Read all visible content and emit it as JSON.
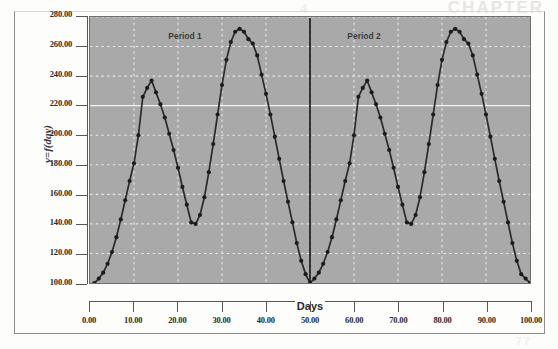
{
  "figure": {
    "y_axis_title": "y=f(day)",
    "x_axis_title": "Days",
    "annotations": [
      {
        "text": "Period 1",
        "x_day": 21.5,
        "y_value": 267.0
      },
      {
        "text": "Period 2",
        "x_day": 62.0,
        "y_value": 267.0
      }
    ],
    "divider_day": 50.0,
    "colors": {
      "plot_background": "#a9a9a9",
      "gridline": "#e8e8e8",
      "highlight_gridline": "#f2f2f2",
      "series_line": "#2a2a2a",
      "marker": "#1c1c1c",
      "axis": "#575757",
      "page_background": "#fdfdfc",
      "text": "#2b2b2b"
    },
    "ghost_text": {
      "top_right": "CHAPTER",
      "top_middle": "4",
      "bottom_right": "77"
    }
  },
  "chart_data": {
    "type": "line",
    "title": "",
    "subtitle": "",
    "xlabel": "Days",
    "ylabel": "y=f(day)",
    "xlim": [
      0,
      100
    ],
    "ylim": [
      100,
      280
    ],
    "xticks": [
      0,
      10,
      20,
      30,
      40,
      50,
      60,
      70,
      80,
      90,
      100
    ],
    "xtick_labels": [
      "0.00",
      "10.00",
      "20.00",
      "30.00",
      "40.00",
      "50.00",
      "60.00",
      "70.00",
      "80.00",
      "90.00",
      "100.00"
    ],
    "yticks": [
      100,
      120,
      140,
      160,
      180,
      200,
      220,
      240,
      260,
      280
    ],
    "ytick_labels": [
      "100.00",
      "120.00",
      "140.00",
      "160.00",
      "180.00",
      "200.00",
      "220.00",
      "240.00",
      "260.00",
      "280.00"
    ],
    "grid": true,
    "grid_style": "dashed",
    "legend": null,
    "markers": "filled-circle",
    "annotations": [
      "Period 1",
      "Period 2"
    ],
    "vertical_divider_x": 50,
    "series": [
      {
        "name": "y=f(day)",
        "x": [
          1,
          2,
          3,
          4,
          5,
          6,
          7,
          8,
          9,
          10,
          11,
          12,
          13,
          14,
          15,
          16,
          17,
          18,
          19,
          20,
          21,
          22,
          23,
          24,
          25,
          26,
          27,
          28,
          29,
          30,
          31,
          32,
          33,
          34,
          35,
          36,
          37,
          38,
          39,
          40,
          41,
          42,
          43,
          44,
          45,
          46,
          47,
          48,
          49,
          50,
          51,
          52,
          53,
          54,
          55,
          56,
          57,
          58,
          59,
          60,
          61,
          62,
          63,
          64,
          65,
          66,
          67,
          68,
          69,
          70,
          71,
          72,
          73,
          74,
          75,
          76,
          77,
          78,
          79,
          80,
          81,
          82,
          83,
          84,
          85,
          86,
          87,
          88,
          89,
          90,
          91,
          92,
          93,
          94,
          95,
          96,
          97,
          98,
          99,
          100
        ],
        "y": [
          100,
          103,
          107,
          113,
          121,
          131,
          143,
          156,
          169,
          181,
          200,
          226,
          232,
          237,
          229,
          221,
          212,
          201,
          190,
          178,
          165,
          153,
          141,
          140,
          146,
          158,
          175,
          194,
          214,
          234,
          251,
          263,
          270,
          272,
          270,
          265,
          262,
          254,
          241,
          228,
          214,
          199,
          184,
          169,
          155,
          141,
          127,
          115,
          106,
          100,
          103,
          107,
          113,
          121,
          131,
          143,
          156,
          169,
          181,
          200,
          226,
          232,
          237,
          229,
          221,
          212,
          201,
          190,
          178,
          165,
          153,
          141,
          140,
          146,
          158,
          175,
          194,
          214,
          234,
          251,
          263,
          270,
          272,
          270,
          265,
          262,
          254,
          241,
          228,
          214,
          199,
          184,
          169,
          155,
          141,
          127,
          115,
          106,
          103,
          100
        ]
      }
    ]
  }
}
